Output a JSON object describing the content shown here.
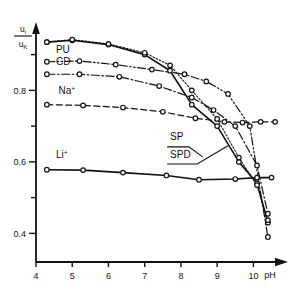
{
  "chart_data": {
    "type": "line",
    "title": "",
    "xlabel": "pH",
    "ylabel": "u_i / u_K",
    "ylabel_numerator": "u",
    "ylabel_numerator_sub": "i",
    "ylabel_denominator": "u",
    "ylabel_denominator_sub": "K",
    "xlim": [
      4.0,
      10.9
    ],
    "ylim": [
      0.32,
      0.98
    ],
    "xticks": [
      4,
      5,
      6,
      7,
      8,
      9,
      10
    ],
    "xticklabels": [
      "4",
      "5",
      "6",
      "7",
      "8",
      "9",
      "10"
    ],
    "yticks": [
      0.4,
      0.5,
      0.6,
      0.7,
      0.8,
      0.9
    ],
    "yticklabels": [
      "0.4",
      "",
      "0.6",
      "",
      "0.8",
      ""
    ],
    "ymajorlabels": [
      "0.4",
      "0.6",
      "0.8"
    ],
    "grid": false,
    "legend_position": "inline-annotations",
    "marker": "open-circle",
    "series": [
      {
        "name": "SP",
        "label": "SP",
        "style": "solid",
        "linewidth": 1.6,
        "x": [
          4.3,
          5.0,
          6.0,
          7.0,
          7.7,
          8.3,
          9.0,
          9.6,
          10.1,
          10.4
        ],
        "y": [
          0.935,
          0.94,
          0.928,
          0.9,
          0.855,
          0.76,
          0.7,
          0.6,
          0.54,
          0.43
        ]
      },
      {
        "name": "SPD",
        "label": "SPD",
        "style": "dotted",
        "linewidth": 1.1,
        "x": [
          4.3,
          5.0,
          6.0,
          7.0,
          7.7,
          8.3,
          9.0,
          9.6,
          10.1,
          10.4
        ],
        "y": [
          0.935,
          0.942,
          0.93,
          0.905,
          0.87,
          0.8,
          0.72,
          0.612,
          0.535,
          0.437
        ]
      },
      {
        "name": "PU",
        "label": "PU",
        "style": "dash-dot-dot",
        "linewidth": 1.2,
        "x": [
          4.3,
          5.2,
          6.2,
          7.2,
          8.1,
          8.7,
          9.3,
          9.9,
          10.4
        ],
        "y": [
          0.88,
          0.882,
          0.872,
          0.858,
          0.845,
          0.825,
          0.79,
          0.7,
          0.39
        ]
      },
      {
        "name": "CD",
        "label": "CD",
        "style": "dash-dot",
        "linewidth": 1.2,
        "x": [
          4.3,
          5.2,
          6.3,
          7.4,
          8.3,
          8.9,
          9.5,
          10.1,
          10.4
        ],
        "y": [
          0.845,
          0.845,
          0.838,
          0.812,
          0.78,
          0.745,
          0.7,
          0.59,
          0.455
        ]
      },
      {
        "name": "Na+",
        "label": "Na",
        "label_superscript": "+",
        "style": "dashed",
        "linewidth": 1.2,
        "x": [
          4.3,
          5.3,
          6.4,
          7.5,
          8.4,
          9.2,
          9.7,
          10.2,
          10.6
        ],
        "y": [
          0.76,
          0.758,
          0.752,
          0.74,
          0.722,
          0.712,
          0.71,
          0.712,
          0.712
        ]
      },
      {
        "name": "Li+",
        "label": "Li",
        "label_superscript": "+",
        "style": "solid",
        "linewidth": 1.6,
        "x": [
          4.3,
          5.3,
          6.4,
          7.6,
          8.5,
          9.5,
          10.1,
          10.5
        ],
        "y": [
          0.578,
          0.577,
          0.57,
          0.562,
          0.55,
          0.552,
          0.556,
          0.556
        ]
      }
    ],
    "annotations": [
      {
        "text": "PU",
        "x": 4.55,
        "y": 0.905,
        "name": "series-label-pu"
      },
      {
        "text": "CD",
        "x": 4.55,
        "y": 0.872,
        "name": "series-label-cd"
      },
      {
        "text": "Na",
        "x": 4.62,
        "y": 0.79,
        "sup": "+",
        "name": "series-label-na"
      },
      {
        "text": "Li",
        "x": 4.55,
        "y": 0.61,
        "sup": "+",
        "name": "series-label-li"
      },
      {
        "text": "SP",
        "x": 7.7,
        "y": 0.66,
        "name": "series-label-sp"
      },
      {
        "text": "SPD",
        "x": 7.7,
        "y": 0.612,
        "name": "series-label-spd"
      }
    ]
  }
}
